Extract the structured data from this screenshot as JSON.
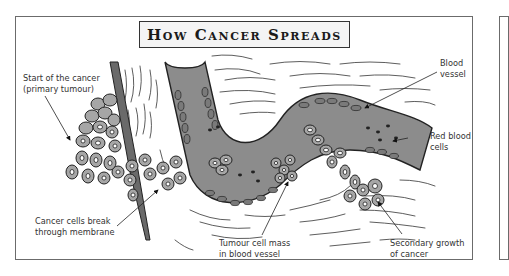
{
  "diagram": {
    "title": "How Cancer Spreads",
    "labels": {
      "primary_tumour": {
        "line1": "Start of the cancer",
        "line2": "(primary tumour)"
      },
      "break_membrane": {
        "line1": "Cancer cells break",
        "line2": "through membrane"
      },
      "tumour_mass": {
        "line1": "Tumour cell mass",
        "line2": "in blood vessel"
      },
      "blood_vessel": {
        "line1": "Blood",
        "line2": "vessel"
      },
      "red_blood_cells": {
        "line1": "Red blood",
        "line2": "cells"
      },
      "secondary_growth": {
        "line1": "Secondary growth",
        "line2": "of cancer"
      }
    },
    "colors": {
      "vessel_fill": "#8c8c8c",
      "vessel_wall": "#5a5a5a",
      "cell_fill": "#a6a6a6",
      "outline": "#222222",
      "frame": "#6b6b6b"
    }
  }
}
